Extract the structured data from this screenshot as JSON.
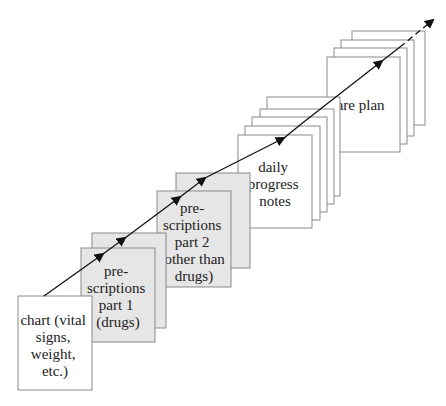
{
  "diagram": {
    "colors": {
      "background": "#ffffff",
      "white_sheet": "#ffffff",
      "gray_sheet": "#e6e6e6",
      "outline": "#8a8a8a",
      "arrow": "#111111"
    },
    "stacks": [
      {
        "id": "chart",
        "fill": "white",
        "sheets": 1,
        "label_lines": [
          "chart (vital",
          "signs,",
          "weight,",
          "etc.)"
        ]
      },
      {
        "id": "prescriptions-1",
        "fill": "gray",
        "sheets": 2,
        "label_lines": [
          "pre-",
          "scriptions",
          "part 1",
          "(drugs)"
        ]
      },
      {
        "id": "prescriptions-2",
        "fill": "gray",
        "sheets": 2,
        "label_lines": [
          "pre-",
          "scriptions",
          "part 2",
          "(other than",
          "drugs)"
        ]
      },
      {
        "id": "daily-progress-notes",
        "fill": "white",
        "sheets": 5,
        "label_lines": [
          "daily",
          "progress",
          "notes"
        ]
      },
      {
        "id": "care-plan",
        "fill": "white",
        "sheets": 4,
        "label_lines": [
          "care plan"
        ]
      }
    ],
    "arrow": {
      "label": "",
      "style_end": "dashed"
    }
  }
}
